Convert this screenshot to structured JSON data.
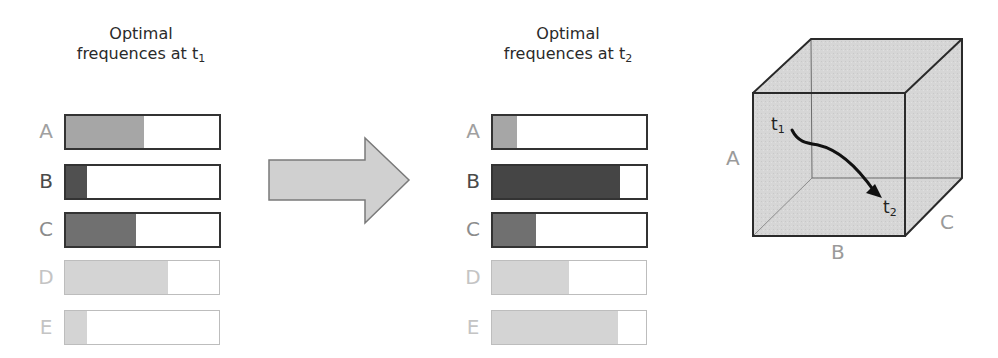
{
  "panels": [
    {
      "id": "t1",
      "title_line1": "Optimal",
      "title_line2": "frequences at t",
      "title_sub": "1",
      "rows": [
        {
          "label": "A",
          "fill_pct": 51,
          "fill_color": "#a6a6a6",
          "label_color": "#a0a0a0",
          "style": "active"
        },
        {
          "label": "B",
          "fill_pct": 14,
          "fill_color": "#505050",
          "label_color": "#4a4a4a",
          "style": "active"
        },
        {
          "label": "C",
          "fill_pct": 46,
          "fill_color": "#707070",
          "label_color": "#8c8c8c",
          "style": "active"
        },
        {
          "label": "D",
          "fill_pct": 67,
          "fill_color": "#d4d4d4",
          "label_color": "#c4c4c4",
          "style": "faded"
        },
        {
          "label": "E",
          "fill_pct": 14,
          "fill_color": "#d4d4d4",
          "label_color": "#c4c4c4",
          "style": "faded"
        }
      ]
    },
    {
      "id": "t2",
      "title_line1": "Optimal",
      "title_line2": "frequences at t",
      "title_sub": "2",
      "rows": [
        {
          "label": "A",
          "fill_pct": 16,
          "fill_color": "#a6a6a6",
          "label_color": "#a0a0a0",
          "style": "active"
        },
        {
          "label": "B",
          "fill_pct": 83,
          "fill_color": "#454545",
          "label_color": "#4a4a4a",
          "style": "active"
        },
        {
          "label": "C",
          "fill_pct": 28,
          "fill_color": "#707070",
          "label_color": "#8c8c8c",
          "style": "active"
        },
        {
          "label": "D",
          "fill_pct": 50,
          "fill_color": "#d4d4d4",
          "label_color": "#c4c4c4",
          "style": "faded"
        },
        {
          "label": "E",
          "fill_pct": 82,
          "fill_color": "#d4d4d4",
          "label_color": "#c4c4c4",
          "style": "faded"
        }
      ]
    }
  ],
  "arrow": {
    "fill": "#d0d0d0",
    "stroke": "#7a7a7a"
  },
  "cube": {
    "axis_labels": {
      "a": "A",
      "b": "B",
      "c": "C"
    },
    "start_label": "t",
    "start_sub": "1",
    "end_label": "t",
    "end_sub": "2",
    "face_color": "#d6d6d6",
    "edge_color": "#2a2a2a"
  }
}
